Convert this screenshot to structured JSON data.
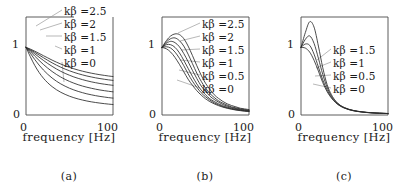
{
  "figure": {
    "panels": [
      {
        "id": "a",
        "caption": "(a)",
        "xlabel": "frequency  [Hz]",
        "x_ticks": [
          "0",
          "100"
        ],
        "y_ticks": [
          "1",
          "0"
        ],
        "labels": [
          {
            "text": "kβ =2.5"
          },
          {
            "text": "kβ =2"
          },
          {
            "text": "kβ =1.5"
          },
          {
            "text": "kβ =1"
          },
          {
            "text": "kβ =0"
          }
        ]
      },
      {
        "id": "b",
        "caption": "(b)",
        "xlabel": "frequency  [Hz]",
        "x_ticks": [
          "0",
          "100"
        ],
        "y_ticks": [
          "1",
          "0"
        ],
        "labels": [
          {
            "text": "kβ =2.5"
          },
          {
            "text": "kβ =2"
          },
          {
            "text": "kβ =1.5"
          },
          {
            "text": "kβ =1"
          },
          {
            "text": "kβ =0.5"
          },
          {
            "text": "kβ =0"
          }
        ]
      },
      {
        "id": "c",
        "caption": "(c)",
        "xlabel": "frequency  [Hz]",
        "x_ticks": [
          "0",
          "100"
        ],
        "y_ticks": [
          "1",
          "0"
        ],
        "labels": [
          {
            "text": "kβ =1.5"
          },
          {
            "text": "kβ =1"
          },
          {
            "text": "kβ =0.5"
          },
          {
            "text": "kβ =0"
          }
        ]
      }
    ]
  },
  "chart_data": [
    {
      "type": "line",
      "panel": "a",
      "title": "(a)",
      "xlabel": "frequency  [Hz]",
      "ylabel": "",
      "xlim": [
        0,
        100
      ],
      "ylim": [
        0,
        1.45
      ],
      "xticks": [
        0,
        100
      ],
      "yticks": [
        0,
        1
      ],
      "grid": false,
      "legend": "inline-leader-lines",
      "x": [
        0,
        5,
        10,
        15,
        20,
        25,
        30,
        35,
        40,
        45,
        50,
        55,
        60,
        65,
        70,
        75,
        80,
        85,
        90,
        95,
        100
      ],
      "series": [
        {
          "name": "kβ =2.5",
          "values": [
            1.0,
            0.975,
            0.945,
            0.912,
            0.878,
            0.845,
            0.812,
            0.782,
            0.754,
            0.728,
            0.705,
            0.684,
            0.665,
            0.648,
            0.633,
            0.619,
            0.607,
            0.596,
            0.586,
            0.577,
            0.569
          ]
        },
        {
          "name": "kβ =2",
          "values": [
            1.0,
            0.966,
            0.928,
            0.888,
            0.848,
            0.809,
            0.772,
            0.738,
            0.707,
            0.679,
            0.654,
            0.631,
            0.611,
            0.593,
            0.577,
            0.563,
            0.55,
            0.539,
            0.529,
            0.52,
            0.512
          ]
        },
        {
          "name": "kβ =1.5",
          "values": [
            1.0,
            0.955,
            0.906,
            0.856,
            0.808,
            0.762,
            0.72,
            0.681,
            0.646,
            0.615,
            0.588,
            0.563,
            0.542,
            0.523,
            0.506,
            0.491,
            0.478,
            0.466,
            0.456,
            0.447,
            0.439
          ]
        },
        {
          "name": "kβ =1",
          "values": [
            1.0,
            0.938,
            0.872,
            0.808,
            0.748,
            0.693,
            0.644,
            0.6,
            0.561,
            0.527,
            0.497,
            0.471,
            0.448,
            0.428,
            0.411,
            0.396,
            0.382,
            0.37,
            0.36,
            0.351,
            0.343
          ]
        },
        {
          "name": "kβ =0.5",
          "values": [
            1.0,
            0.912,
            0.822,
            0.739,
            0.666,
            0.602,
            0.547,
            0.5,
            0.46,
            0.426,
            0.396,
            0.371,
            0.349,
            0.33,
            0.313,
            0.299,
            0.286,
            0.275,
            0.266,
            0.257,
            0.25
          ]
        },
        {
          "name": "kβ =0",
          "values": [
            1.0,
            0.862,
            0.735,
            0.63,
            0.545,
            0.476,
            0.42,
            0.374,
            0.336,
            0.305,
            0.278,
            0.256,
            0.237,
            0.221,
            0.207,
            0.195,
            0.185,
            0.176,
            0.168,
            0.161,
            0.155
          ]
        }
      ]
    },
    {
      "type": "line",
      "panel": "b",
      "title": "(b)",
      "xlabel": "frequency  [Hz]",
      "ylabel": "",
      "xlim": [
        0,
        100
      ],
      "ylim": [
        0,
        1.45
      ],
      "xticks": [
        0,
        100
      ],
      "yticks": [
        0,
        1
      ],
      "grid": false,
      "legend": "inline-leader-lines",
      "x": [
        0,
        5,
        10,
        15,
        20,
        25,
        30,
        35,
        40,
        45,
        50,
        55,
        60,
        65,
        70,
        75,
        80,
        85,
        90,
        95,
        100
      ],
      "series": [
        {
          "name": "kβ =2.5",
          "values": [
            1.0,
            1.1,
            1.17,
            1.2,
            1.19,
            1.13,
            1.02,
            0.88,
            0.73,
            0.59,
            0.47,
            0.38,
            0.3,
            0.245,
            0.2,
            0.165,
            0.14,
            0.12,
            0.1,
            0.09,
            0.08
          ]
        },
        {
          "name": "kβ =2",
          "values": [
            1.0,
            1.08,
            1.13,
            1.14,
            1.1,
            1.02,
            0.9,
            0.76,
            0.62,
            0.5,
            0.4,
            0.32,
            0.26,
            0.21,
            0.175,
            0.145,
            0.12,
            0.105,
            0.09,
            0.08,
            0.07
          ]
        },
        {
          "name": "kβ =1.5",
          "values": [
            1.0,
            1.06,
            1.09,
            1.07,
            1.01,
            0.91,
            0.79,
            0.66,
            0.54,
            0.43,
            0.35,
            0.28,
            0.23,
            0.19,
            0.155,
            0.13,
            0.11,
            0.095,
            0.082,
            0.072,
            0.064
          ]
        },
        {
          "name": "kβ =1",
          "values": [
            1.0,
            1.04,
            1.04,
            1.0,
            0.92,
            0.81,
            0.69,
            0.57,
            0.46,
            0.37,
            0.3,
            0.24,
            0.2,
            0.165,
            0.135,
            0.115,
            0.098,
            0.085,
            0.074,
            0.065,
            0.058
          ]
        },
        {
          "name": "kβ =0.5",
          "values": [
            1.0,
            1.01,
            0.99,
            0.93,
            0.84,
            0.73,
            0.61,
            0.5,
            0.41,
            0.33,
            0.27,
            0.22,
            0.18,
            0.15,
            0.124,
            0.105,
            0.09,
            0.078,
            0.068,
            0.06,
            0.054
          ]
        },
        {
          "name": "kβ =0",
          "values": [
            1.0,
            0.98,
            0.93,
            0.85,
            0.75,
            0.64,
            0.53,
            0.44,
            0.36,
            0.295,
            0.24,
            0.198,
            0.165,
            0.138,
            0.116,
            0.099,
            0.085,
            0.073,
            0.064,
            0.057,
            0.051
          ]
        }
      ]
    },
    {
      "type": "line",
      "panel": "c",
      "title": "(c)",
      "xlabel": "frequency  [Hz]",
      "ylabel": "",
      "xlim": [
        0,
        100
      ],
      "ylim": [
        0,
        1.45
      ],
      "xticks": [
        0,
        100
      ],
      "yticks": [
        0,
        1
      ],
      "grid": false,
      "legend": "inline-leader-lines",
      "x": [
        0,
        5,
        10,
        15,
        20,
        25,
        30,
        35,
        40,
        45,
        50,
        55,
        60,
        65,
        70,
        75,
        80,
        85,
        90,
        95,
        100
      ],
      "series": [
        {
          "name": "kβ =1.5",
          "values": [
            1.0,
            1.22,
            1.38,
            1.3,
            1.02,
            0.7,
            0.45,
            0.3,
            0.205,
            0.145,
            0.11,
            0.085,
            0.068,
            0.056,
            0.047,
            0.04,
            0.035,
            0.031,
            0.028,
            0.025,
            0.023
          ]
        },
        {
          "name": "kβ =1",
          "values": [
            1.0,
            1.12,
            1.17,
            1.06,
            0.84,
            0.6,
            0.41,
            0.28,
            0.195,
            0.142,
            0.107,
            0.083,
            0.067,
            0.055,
            0.046,
            0.039,
            0.034,
            0.03,
            0.027,
            0.024,
            0.022
          ]
        },
        {
          "name": "kβ =0.5",
          "values": [
            1.0,
            1.05,
            1.03,
            0.9,
            0.71,
            0.52,
            0.37,
            0.26,
            0.185,
            0.136,
            0.103,
            0.081,
            0.065,
            0.053,
            0.045,
            0.038,
            0.033,
            0.029,
            0.026,
            0.024,
            0.021
          ]
        },
        {
          "name": "kβ =0",
          "values": [
            1.0,
            0.99,
            0.93,
            0.81,
            0.65,
            0.48,
            0.345,
            0.25,
            0.18,
            0.133,
            0.101,
            0.079,
            0.063,
            0.052,
            0.044,
            0.037,
            0.032,
            0.028,
            0.025,
            0.023,
            0.021
          ]
        }
      ]
    }
  ],
  "style": {
    "curve_color": "#2b2b2b",
    "axis_color": "#4a4a4a",
    "leader_color": "#9a9a9a",
    "background": "#ffffff"
  }
}
